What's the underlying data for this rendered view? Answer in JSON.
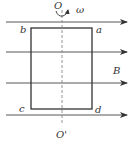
{
  "diagram": {
    "labels": {
      "axis_top": "O",
      "axis_bottom": "O'",
      "angular_velocity": "ω",
      "field": "B",
      "corner_top_left": "b",
      "corner_top_right": "a",
      "corner_bottom_left": "c",
      "corner_bottom_right": "d"
    },
    "field_lines": {
      "count": 4,
      "direction": "right"
    },
    "colors": {
      "line": "#333333",
      "axis": "#888888",
      "background": "#ffffff"
    }
  }
}
